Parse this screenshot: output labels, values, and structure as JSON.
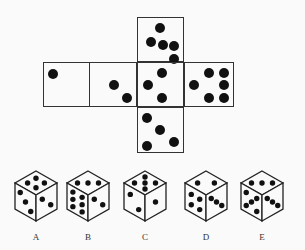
{
  "net": {
    "faces": [
      {
        "id": "top",
        "x": 137,
        "y": 17,
        "w": 47,
        "h": 45,
        "dots": [
          [
            0.47,
            0.22
          ],
          [
            0.27,
            0.53
          ],
          [
            0.53,
            0.6
          ],
          [
            0.77,
            0.63
          ],
          [
            0.77,
            0.92
          ]
        ]
      },
      {
        "id": "left-far",
        "x": 43,
        "y": 62,
        "w": 47,
        "h": 45,
        "dots": [
          [
            0.2,
            0.25
          ]
        ]
      },
      {
        "id": "left",
        "x": 89,
        "y": 62,
        "w": 48,
        "h": 45,
        "dots": [
          [
            0.5,
            0.49
          ],
          [
            0.78,
            0.78
          ]
        ]
      },
      {
        "id": "center",
        "x": 137,
        "y": 62,
        "w": 47,
        "h": 45,
        "dots": [
          [
            0.5,
            0.22
          ],
          [
            0.22,
            0.49
          ],
          [
            0.5,
            0.78
          ]
        ]
      },
      {
        "id": "right",
        "x": 184,
        "y": 62,
        "w": 50,
        "h": 45,
        "dots": [
          [
            0.17,
            0.49
          ],
          [
            0.47,
            0.23
          ],
          [
            0.78,
            0.23
          ],
          [
            0.78,
            0.49
          ],
          [
            0.47,
            0.78
          ],
          [
            0.78,
            0.78
          ]
        ]
      },
      {
        "id": "bottom",
        "x": 137,
        "y": 107,
        "w": 47,
        "h": 46,
        "dots": [
          [
            0.2,
            0.22
          ],
          [
            0.47,
            0.47
          ],
          [
            0.77,
            0.73
          ],
          [
            0.2,
            0.83
          ]
        ]
      }
    ]
  },
  "options": [
    {
      "label": "A",
      "cx": 36,
      "top_dots": 4,
      "left_dots": 3,
      "right_dots": 2
    },
    {
      "label": "B",
      "cx": 88,
      "top_dots": 3,
      "left_dots": 6,
      "right_dots": 2
    },
    {
      "label": "C",
      "cx": 145,
      "top_dots": 5,
      "left_dots": 2,
      "right_dots": 1
    },
    {
      "label": "D",
      "cx": 206,
      "top_dots": 2,
      "left_dots": 4,
      "right_dots": 3
    },
    {
      "label": "E",
      "cx": 262,
      "top_dots": 3,
      "left_dots": 5,
      "right_dots": 3
    }
  ]
}
